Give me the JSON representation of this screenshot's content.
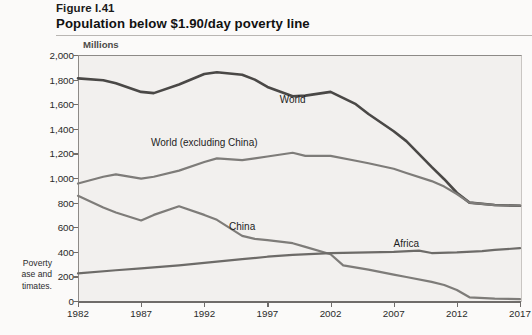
{
  "header": {
    "figure_label": "Figure I.41",
    "title": "Population below $1.90/day poverty line"
  },
  "gutter_note": {
    "line1": "Poverty",
    "line2": "ase and",
    "line3": "timates."
  },
  "bleed_text": [
    "in millions of people below the poverty line",
    "data from the World Bank PovcalNet database",
    "regional aggregates and global estimates",
    "The World Bank Group projections for 2017",
    "indicate 769 million people below the",
    "of $1.90 per day, of which about 413",
    "Reducing the rate of extreme poverty",
    "remains the single greatest challenge",
    "the 2030 Agenda for Sustainable"
  ],
  "chart_data": {
    "type": "line",
    "title": "Population below $1.90/day poverty line",
    "xlabel": "",
    "ylabel": "Millions",
    "units_label": "Millions",
    "xlim": [
      1982,
      2017
    ],
    "ylim": [
      0,
      2000
    ],
    "grid": false,
    "legend_position": "inline-annotations",
    "xticks": [
      1982,
      1987,
      1992,
      1997,
      2002,
      2007,
      2012,
      2017
    ],
    "xtick_labels": [
      "1982",
      "1987",
      "1992",
      "1997",
      "2002",
      "2007",
      "2012",
      "2017"
    ],
    "yticks": [
      0,
      200,
      400,
      600,
      800,
      1000,
      1200,
      1400,
      1600,
      1800,
      2000
    ],
    "ytick_labels": [
      "0",
      "200",
      "400",
      "600",
      "800",
      "1,000",
      "1,200",
      "1,400",
      "1,600",
      "1,800",
      "2,000"
    ],
    "colors": {
      "world": "#4a4846",
      "world_excluding_china": "#7e7c79",
      "china": "#7e7c79",
      "africa": "#6d6b68",
      "plot_background": "#f2f0ee",
      "axis": "#6f6c6a"
    },
    "series": [
      {
        "name": "World",
        "color": "#4a4846",
        "label_x": 1999,
        "label_y": 1640,
        "x": [
          1982,
          1984,
          1985,
          1987,
          1988,
          1990,
          1992,
          1993,
          1995,
          1996,
          1997,
          1999,
          2000,
          2002,
          2004,
          2005,
          2007,
          2008,
          2010,
          2011,
          2012,
          2013,
          2015,
          2017
        ],
        "values": [
          1810,
          1795,
          1770,
          1700,
          1690,
          1760,
          1845,
          1860,
          1840,
          1800,
          1740,
          1665,
          1670,
          1700,
          1600,
          1520,
          1380,
          1300,
          1090,
          990,
          880,
          800,
          780,
          775
        ]
      },
      {
        "name": "World (excluding China)",
        "color": "#7e7c79",
        "label_x": 1992,
        "label_y": 1290,
        "x": [
          1982,
          1984,
          1985,
          1987,
          1988,
          1990,
          1992,
          1993,
          1995,
          1996,
          1997,
          1999,
          2000,
          2002,
          2004,
          2005,
          2007,
          2008,
          2010,
          2011,
          2012,
          2013,
          2015,
          2017
        ],
        "values": [
          955,
          1010,
          1030,
          995,
          1010,
          1060,
          1130,
          1160,
          1145,
          1160,
          1175,
          1205,
          1180,
          1180,
          1140,
          1120,
          1075,
          1040,
          975,
          930,
          870,
          800,
          780,
          775
        ]
      },
      {
        "name": "China",
        "color": "#7e7c79",
        "label_x": 1995,
        "label_y": 610,
        "x": [
          1982,
          1984,
          1985,
          1987,
          1988,
          1990,
          1992,
          1993,
          1995,
          1996,
          1997,
          1999,
          2000,
          2002,
          2003,
          2005,
          2007,
          2008,
          2010,
          2011,
          2012,
          2013,
          2015,
          2017
        ],
        "values": [
          855,
          760,
          720,
          655,
          700,
          770,
          700,
          660,
          530,
          505,
          495,
          470,
          440,
          380,
          290,
          255,
          215,
          195,
          155,
          130,
          90,
          30,
          20,
          15
        ]
      },
      {
        "name": "Africa",
        "color": "#6d6b68",
        "label_x": 2008,
        "label_y": 470,
        "x": [
          1982,
          1985,
          1987,
          1990,
          1992,
          1995,
          1997,
          1999,
          2002,
          2005,
          2007,
          2009,
          2010,
          2012,
          2014,
          2015,
          2017
        ],
        "values": [
          225,
          250,
          265,
          290,
          310,
          340,
          360,
          375,
          390,
          395,
          400,
          410,
          390,
          395,
          405,
          415,
          430
        ]
      }
    ]
  }
}
